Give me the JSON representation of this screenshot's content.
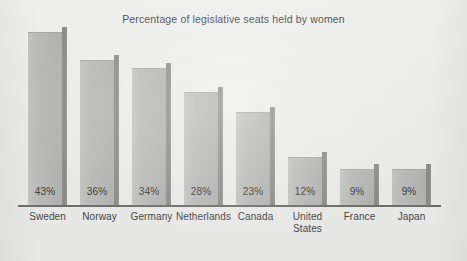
{
  "chart_data": {
    "type": "bar",
    "title": "Percentage of legislative seats held by women",
    "xlabel": "",
    "ylabel": "",
    "ylim": [
      0,
      50
    ],
    "grid": false,
    "legend": null,
    "value_label_suffix": "%",
    "categories": [
      "Sweden",
      "Norway",
      "Germany",
      "Netherlands",
      "Canada",
      "United States",
      "France",
      "Japan"
    ],
    "values": [
      43,
      36,
      34,
      28,
      23,
      12,
      9,
      9
    ],
    "value_labels": [
      "43%",
      "36%",
      "34%",
      "28%",
      "23%",
      "12%",
      "9%",
      "9%"
    ],
    "bars": [
      {
        "category": "Sweden",
        "label": "Sweden",
        "value": 43,
        "value_label": "43%",
        "label_line_1": "Sweden",
        "label_line_2": ""
      },
      {
        "category": "Norway",
        "label": "Norway",
        "value": 36,
        "value_label": "36%",
        "label_line_1": "Norway",
        "label_line_2": ""
      },
      {
        "category": "Germany",
        "label": "Germany",
        "value": 34,
        "value_label": "34%",
        "label_line_1": "Germany",
        "label_line_2": ""
      },
      {
        "category": "Netherlands",
        "label": "Netherlands",
        "value": 28,
        "value_label": "28%",
        "label_line_1": "Netherlands",
        "label_line_2": ""
      },
      {
        "category": "Canada",
        "label": "Canada",
        "value": 23,
        "value_label": "23%",
        "label_line_1": "Canada",
        "label_line_2": ""
      },
      {
        "category": "United States",
        "label": "United States",
        "value": 12,
        "value_label": "12%",
        "label_line_1": "United",
        "label_line_2": "States"
      },
      {
        "category": "France",
        "label": "France",
        "value": 9,
        "value_label": "9%",
        "label_line_1": "France",
        "label_line_2": ""
      },
      {
        "category": "Japan",
        "label": "Japan",
        "value": 9,
        "value_label": "9%",
        "label_line_1": "Japan",
        "label_line_2": ""
      }
    ],
    "colors": {
      "background": "#ececeb",
      "bar_face": "#b9b9b7",
      "bar_shadow": "#8e8e8c",
      "axis": "#6d6d6b",
      "title_text": "#4a4a4a",
      "label_text": "#454545",
      "value_text": "#3d3d3d"
    }
  }
}
